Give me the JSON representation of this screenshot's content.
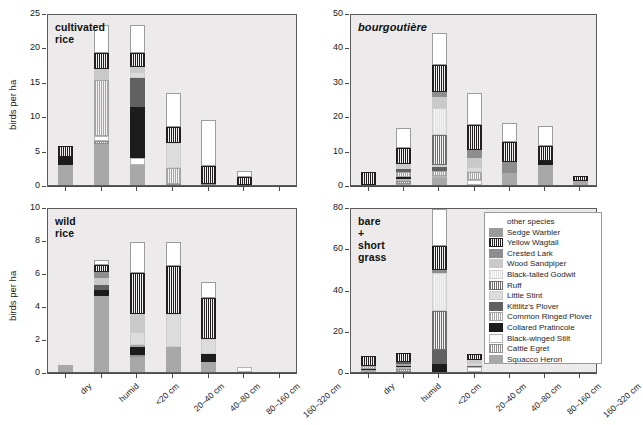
{
  "figure": {
    "y_axis_label": "birds per ha",
    "categories": [
      "dry",
      "humid",
      "<20 cm",
      "20–40 cm",
      "40–80 cm",
      "80–160 cm",
      "160–320 cm"
    ]
  },
  "species": [
    {
      "key": "other",
      "label": "other species",
      "fill": "#ffffff",
      "pattern": "solid",
      "border": "#9c9c9c"
    },
    {
      "key": "sedge",
      "label": "Sedge Warbler",
      "fill": "#9a9a9a",
      "pattern": "solid",
      "border": "#9a9a9a"
    },
    {
      "key": "yellowwag",
      "label": "Yellow Wagtail",
      "fill": "#231f20",
      "pattern": "vline",
      "border": "#231f20"
    },
    {
      "key": "crestedlark",
      "label": "Crested Lark",
      "fill": "#8e8e8e",
      "pattern": "solid",
      "border": "#8e8e8e"
    },
    {
      "key": "woodsand",
      "label": "Wood Sandpiper",
      "fill": "#c9c9c9",
      "pattern": "solid",
      "border": "#c9c9c9"
    },
    {
      "key": "godwit",
      "label": "Black-tailed Godwit",
      "fill": "#e3e3e3",
      "pattern": "vline",
      "border": "#cfcfcf"
    },
    {
      "key": "ruff",
      "label": "Ruff",
      "fill": "#6e6e6e",
      "pattern": "vline",
      "border": "#6e6e6e"
    },
    {
      "key": "littlestint",
      "label": "Little Stint",
      "fill": "#dcdcdc",
      "pattern": "solid",
      "border": "#cdcdcd"
    },
    {
      "key": "kittlitz",
      "label": "Kittlitz's Plover",
      "fill": "#616161",
      "pattern": "solid",
      "border": "#616161"
    },
    {
      "key": "ringplover",
      "label": "Common Ringed Plover",
      "fill": "#a5a5a5",
      "pattern": "vline",
      "border": "#a5a5a5"
    },
    {
      "key": "pratincole",
      "label": "Collared Pratincole",
      "fill": "#1c1c1c",
      "pattern": "solid",
      "border": "#1c1c1c"
    },
    {
      "key": "stilt",
      "label": "Black-winged Stilt",
      "fill": "#ffffff",
      "pattern": "solid",
      "border": "#b5b5b5"
    },
    {
      "key": "cattleegret",
      "label": "Cattle Egret",
      "fill": "#909090",
      "pattern": "vline",
      "border": "#909090"
    },
    {
      "key": "squacco",
      "label": "Squacco Heron",
      "fill": "#a8a8a8",
      "pattern": "solid",
      "border": "#a8a8a8"
    }
  ],
  "chart_data": [
    {
      "id": "cultivated-rice",
      "type": "bar",
      "title": "cultivated rice",
      "title_style": "bold",
      "xlabel": "",
      "ylabel": "birds per ha",
      "ylim": [
        0,
        25
      ],
      "yticks": [
        0,
        5,
        10,
        15,
        20,
        25
      ],
      "stacked": true,
      "grid": false,
      "categories": [
        "dry",
        "humid",
        "<20 cm",
        "20–40 cm",
        "40–80 cm",
        "80–160 cm",
        "160–320 cm"
      ],
      "totals": [
        5.6,
        23.2,
        23.2,
        13.4,
        9.5,
        2.0,
        0.0
      ],
      "series": [
        {
          "name": "Squacco Heron",
          "key": "squacco",
          "values": [
            2.9,
            6.0,
            2.9,
            0.0,
            0.0,
            0.0,
            0.0
          ]
        },
        {
          "name": "Cattle Egret",
          "key": "cattleegret",
          "values": [
            0.0,
            0.4,
            0.0,
            0.2,
            0.2,
            0.0,
            0.0
          ]
        },
        {
          "name": "Black-winged Stilt",
          "key": "stilt",
          "values": [
            0.0,
            0.7,
            1.0,
            0.0,
            0.0,
            0.0,
            0.0
          ]
        },
        {
          "name": "Collared Pratincole",
          "key": "pratincole",
          "values": [
            1.2,
            0.0,
            7.4,
            0.0,
            0.0,
            0.0,
            0.0
          ]
        },
        {
          "name": "Common Ringed Plover",
          "key": "ringplover",
          "values": [
            0.0,
            8.2,
            0.0,
            2.3,
            0.0,
            0.0,
            0.0
          ]
        },
        {
          "name": "Kittlitz's Plover",
          "key": "kittlitz",
          "values": [
            0.0,
            0.0,
            4.2,
            0.0,
            0.0,
            0.0,
            0.0
          ]
        },
        {
          "name": "Little Stint",
          "key": "littlestint",
          "values": [
            0.0,
            0.0,
            0.9,
            3.6,
            0.0,
            0.0,
            0.0
          ]
        },
        {
          "name": "Ruff",
          "key": "ruff",
          "values": [
            0.0,
            0.0,
            0.0,
            0.0,
            0.0,
            0.0,
            0.0
          ]
        },
        {
          "name": "Black-tailed Godwit",
          "key": "godwit",
          "values": [
            0.0,
            0.0,
            0.0,
            0.0,
            0.0,
            0.0,
            0.0
          ]
        },
        {
          "name": "Wood Sandpiper",
          "key": "woodsand",
          "values": [
            0.0,
            1.6,
            0.8,
            0.0,
            0.0,
            0.0,
            0.0
          ]
        },
        {
          "name": "Crested Lark",
          "key": "crestedlark",
          "values": [
            0.0,
            0.0,
            0.0,
            0.0,
            0.0,
            0.0,
            0.0
          ]
        },
        {
          "name": "Yellow Wagtail",
          "key": "yellowwag",
          "values": [
            1.5,
            2.3,
            2.0,
            2.4,
            2.6,
            1.2,
            0.0
          ]
        },
        {
          "name": "other species",
          "key": "other",
          "values": [
            0.0,
            4.0,
            4.0,
            4.9,
            6.7,
            0.8,
            0.0
          ]
        }
      ]
    },
    {
      "id": "bourgoutiere",
      "type": "bar",
      "title": "bourgoutière",
      "title_style": "bold-italic",
      "xlabel": "",
      "ylabel": "",
      "ylim": [
        0,
        50
      ],
      "yticks": [
        0,
        10,
        20,
        30,
        40,
        50
      ],
      "stacked": true,
      "grid": false,
      "categories": [
        "dry",
        "humid",
        "<20 cm",
        "20–40 cm",
        "40–80 cm",
        "80–160 cm",
        "160–320 cm"
      ],
      "totals": [
        3.7,
        16.5,
        44.2,
        26.8,
        21.9,
        17.3,
        2.6
      ],
      "series": [
        {
          "name": "Squacco Heron",
          "key": "squacco",
          "values": [
            0.0,
            0.4,
            2.1,
            0.0,
            3.6,
            5.8,
            1.2
          ]
        },
        {
          "name": "Cattle Egret",
          "key": "cattleegret",
          "values": [
            0.0,
            0.8,
            0.0,
            0.0,
            0.0,
            0.0,
            0.0
          ]
        },
        {
          "name": "Black-winged Stilt",
          "key": "stilt",
          "values": [
            0.0,
            0.5,
            0.5,
            1.4,
            0.0,
            0.0,
            0.0
          ]
        },
        {
          "name": "Collared Pratincole",
          "key": "pratincole",
          "values": [
            0.0,
            0.7,
            0.0,
            0.0,
            0.0,
            1.1,
            0.0
          ]
        },
        {
          "name": "Common Ringed Plover",
          "key": "ringplover",
          "values": [
            0.0,
            1.4,
            1.6,
            2.5,
            0.0,
            0.0,
            0.0
          ]
        },
        {
          "name": "Kittlitz's Plover",
          "key": "kittlitz",
          "values": [
            0.0,
            0.8,
            1.0,
            0.0,
            0.0,
            0.0,
            0.0
          ]
        },
        {
          "name": "Little Stint",
          "key": "littlestint",
          "values": [
            0.0,
            0.6,
            0.5,
            1.3,
            0.0,
            0.0,
            0.0
          ]
        },
        {
          "name": "Ruff",
          "key": "ruff",
          "values": [
            0.0,
            0.0,
            8.8,
            0.0,
            0.0,
            0.0,
            0.0
          ]
        },
        {
          "name": "Black-tailed Godwit",
          "key": "godwit",
          "values": [
            0.0,
            0.0,
            8.0,
            0.0,
            0.0,
            0.0,
            0.0
          ]
        },
        {
          "name": "Wood Sandpiper",
          "key": "woodsand",
          "values": [
            0.0,
            0.9,
            3.0,
            2.6,
            0.0,
            0.0,
            0.0
          ]
        },
        {
          "name": "Crested Lark",
          "key": "crestedlark",
          "values": [
            0.0,
            0.0,
            1.6,
            2.4,
            3.0,
            0.0,
            0.0
          ]
        },
        {
          "name": "Yellow Wagtail",
          "key": "yellowwag",
          "values": [
            3.7,
            4.6,
            7.8,
            7.2,
            5.9,
            4.3,
            1.4
          ]
        },
        {
          "name": "other species",
          "key": "other",
          "values": [
            0.0,
            5.8,
            9.3,
            9.4,
            5.4,
            6.1,
            0.0
          ]
        }
      ]
    },
    {
      "id": "wild-rice",
      "type": "bar",
      "title": "wild rice",
      "title_style": "bold",
      "xlabel": "",
      "ylabel": "birds per ha",
      "ylim": [
        0,
        10
      ],
      "yticks": [
        0,
        2,
        4,
        6,
        8,
        10
      ],
      "stacked": true,
      "grid": false,
      "categories": [
        "dry",
        "humid",
        "<20 cm",
        "20–40 cm",
        "40–80 cm",
        "80–160 cm",
        "160–320 cm"
      ],
      "totals": [
        0.45,
        6.5,
        7.9,
        7.85,
        5.45,
        0.3,
        0.0
      ],
      "series": [
        {
          "name": "Squacco Heron",
          "key": "squacco",
          "values": [
            0.45,
            4.6,
            0.9,
            1.5,
            0.6,
            0.0,
            0.0
          ]
        },
        {
          "name": "Cattle Egret",
          "key": "cattleegret",
          "values": [
            0.0,
            0.0,
            0.15,
            0.0,
            0.0,
            0.0,
            0.0
          ]
        },
        {
          "name": "Black-winged Stilt",
          "key": "stilt",
          "values": [
            0.0,
            0.0,
            0.0,
            0.0,
            0.0,
            0.3,
            0.0
          ]
        },
        {
          "name": "Collared Pratincole",
          "key": "pratincole",
          "values": [
            0.0,
            0.35,
            0.45,
            0.0,
            0.5,
            0.0,
            0.0
          ]
        },
        {
          "name": "Common Ringed Plover",
          "key": "ringplover",
          "values": [
            0.0,
            0.0,
            0.15,
            0.0,
            0.0,
            0.0,
            0.0
          ]
        },
        {
          "name": "Kittlitz's Plover",
          "key": "kittlitz",
          "values": [
            0.0,
            0.3,
            0.0,
            0.0,
            0.0,
            0.0,
            0.0
          ]
        },
        {
          "name": "Little Stint",
          "key": "littlestint",
          "values": [
            0.0,
            0.0,
            0.75,
            2.0,
            0.9,
            0.0,
            0.0
          ]
        },
        {
          "name": "Ruff",
          "key": "ruff",
          "values": [
            0.0,
            0.0,
            0.0,
            0.0,
            0.0,
            0.0,
            0.0
          ]
        },
        {
          "name": "Black-tailed Godwit",
          "key": "godwit",
          "values": [
            0.0,
            0.0,
            0.0,
            0.0,
            0.0,
            0.0,
            0.0
          ]
        },
        {
          "name": "Wood Sandpiper",
          "key": "woodsand",
          "values": [
            0.0,
            0.45,
            1.1,
            0.0,
            0.0,
            0.0,
            0.0
          ]
        },
        {
          "name": "Crested Lark",
          "key": "crestedlark",
          "values": [
            0.0,
            0.35,
            0.0,
            0.0,
            0.0,
            0.0,
            0.0
          ]
        },
        {
          "name": "Yellow Wagtail",
          "key": "yellowwag",
          "values": [
            0.0,
            0.45,
            2.5,
            2.9,
            2.5,
            0.0,
            0.0
          ]
        },
        {
          "name": "other species",
          "key": "other",
          "values": [
            0.0,
            0.3,
            1.9,
            1.45,
            0.95,
            0.0,
            0.0
          ]
        }
      ]
    },
    {
      "id": "bare-short-grass",
      "type": "bar",
      "title": "bare +\nshort grass",
      "title_style": "bold",
      "xlabel": "",
      "ylabel": "",
      "ylim": [
        0,
        80
      ],
      "yticks": [
        0,
        20,
        40,
        60,
        80
      ],
      "stacked": true,
      "grid": false,
      "categories": [
        "dry",
        "humid",
        "<20 cm",
        "20–40 cm",
        "40–80 cm",
        "80–160 cm",
        "160–320 cm"
      ],
      "totals": [
        7.7,
        9.2,
        79.0,
        8.6,
        0.0,
        0.0,
        0.0
      ],
      "series": [
        {
          "name": "Squacco Heron",
          "key": "squacco",
          "values": [
            0.8,
            0.0,
            0.0,
            0.0,
            0.0,
            0.0,
            0.0
          ]
        },
        {
          "name": "Cattle Egret",
          "key": "cattleegret",
          "values": [
            0.0,
            1.6,
            0.0,
            0.0,
            0.0,
            0.0,
            0.0
          ]
        },
        {
          "name": "Black-winged Stilt",
          "key": "stilt",
          "values": [
            0.0,
            0.6,
            0.0,
            2.2,
            0.0,
            0.0,
            0.0
          ]
        },
        {
          "name": "Collared Pratincole",
          "key": "pratincole",
          "values": [
            0.8,
            0.8,
            4.0,
            0.0,
            0.0,
            0.0,
            0.0
          ]
        },
        {
          "name": "Common Ringed Plover",
          "key": "ringplover",
          "values": [
            1.4,
            1.0,
            0.0,
            0.0,
            0.0,
            0.0,
            0.0
          ]
        },
        {
          "name": "Kittlitz's Plover",
          "key": "kittlitz",
          "values": [
            0.0,
            0.8,
            6.5,
            0.9,
            0.0,
            0.0,
            0.0
          ]
        },
        {
          "name": "Little Stint",
          "key": "littlestint",
          "values": [
            0.0,
            0.0,
            0.0,
            1.4,
            0.0,
            0.0,
            0.0
          ]
        },
        {
          "name": "Ruff",
          "key": "ruff",
          "values": [
            0.0,
            0.0,
            19.0,
            0.0,
            0.0,
            0.0,
            0.0
          ]
        },
        {
          "name": "Black-tailed Godwit",
          "key": "godwit",
          "values": [
            0.0,
            0.0,
            18.5,
            0.0,
            0.0,
            0.0,
            0.0
          ]
        },
        {
          "name": "Wood Sandpiper",
          "key": "woodsand",
          "values": [
            0.0,
            0.0,
            0.0,
            1.5,
            0.0,
            0.0,
            0.0
          ]
        },
        {
          "name": "Crested Lark",
          "key": "crestedlark",
          "values": [
            0.0,
            0.0,
            1.6,
            0.0,
            0.0,
            0.0,
            0.0
          ]
        },
        {
          "name": "Yellow Wagtail",
          "key": "yellowwag",
          "values": [
            4.7,
            4.4,
            11.4,
            2.6,
            0.0,
            0.0,
            0.0
          ]
        },
        {
          "name": "other species",
          "key": "other",
          "values": [
            0.0,
            0.0,
            18.0,
            0.0,
            0.0,
            0.0,
            0.0
          ]
        }
      ]
    }
  ]
}
